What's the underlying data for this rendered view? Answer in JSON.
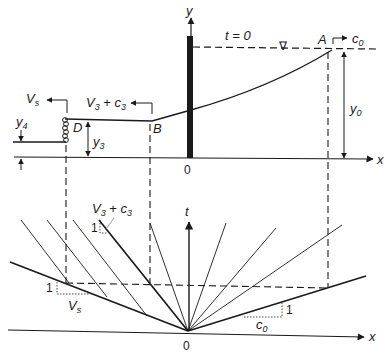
{
  "diagram": {
    "top_panel": {
      "axis_x_label": "x",
      "axis_y_label": "y",
      "origin_label": "0",
      "time_label": "t = 0",
      "point_A": "A",
      "point_B": "B",
      "point_D": "D",
      "wave_speed_A": {
        "base": "c",
        "sub": "0"
      },
      "wave_speed_B": {
        "base1": "V",
        "sub1": "3",
        "op": " + ",
        "base2": "c",
        "sub2": "3"
      },
      "surge_speed": {
        "base": "V",
        "sub": "s"
      },
      "depth_y0": {
        "base": "y",
        "sub": "0"
      },
      "depth_y3": {
        "base": "y",
        "sub": "3"
      },
      "depth_y4": {
        "base": "y",
        "sub": "4"
      },
      "water_surface_symbol": "∇"
    },
    "bottom_panel": {
      "axis_x_label": "x",
      "axis_t_label": "t",
      "origin_label": "0",
      "slope_c0": {
        "base": "c",
        "sub": "0",
        "rise": "1"
      },
      "slope_Vs": {
        "base": "V",
        "sub": "s",
        "rise": "1"
      },
      "slope_V3c3": {
        "base1": "V",
        "sub1": "3",
        "op": " + ",
        "base2": "c",
        "sub2": "3",
        "rise": "1"
      }
    }
  }
}
